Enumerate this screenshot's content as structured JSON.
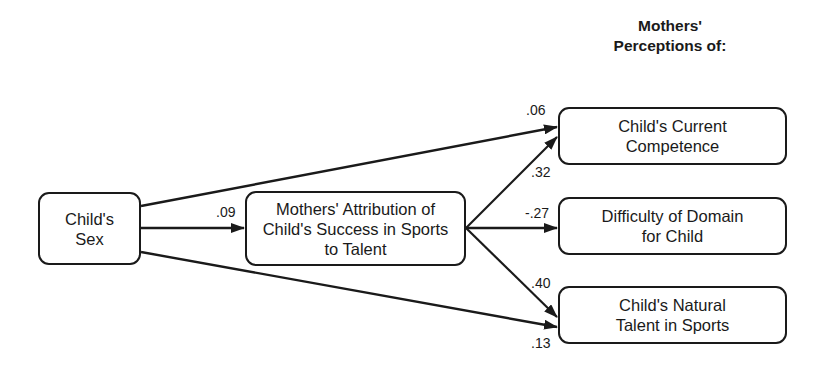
{
  "header": {
    "line1": "Mothers'",
    "line2": "Perceptions of:"
  },
  "nodes": {
    "child_sex": {
      "line1": "Child's",
      "line2": "Sex"
    },
    "attribution": {
      "line1": "Mothers' Attribution of",
      "line2": "Child's Success in Sports",
      "line3": "to Talent"
    },
    "current_competence": {
      "line1": "Child's Current",
      "line2": "Competence"
    },
    "difficulty": {
      "line1": "Difficulty of Domain",
      "line2": "for Child"
    },
    "natural_talent": {
      "line1": "Child's Natural",
      "line2": "Talent in Sports"
    }
  },
  "paths": {
    "sex_to_attribution": ".09",
    "sex_to_competence": ".06",
    "attribution_to_competence": ".32",
    "attribution_to_difficulty": "-.27",
    "attribution_to_talent": ".40",
    "sex_to_talent": ".13"
  },
  "colors": {
    "stroke": "#1a1a1a",
    "background": "#ffffff"
  }
}
